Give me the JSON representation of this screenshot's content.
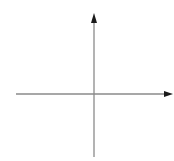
{
  "diagram": {
    "type": "coordinate-axes",
    "background": "#ffffff",
    "axis_color": "#8a8a8a",
    "arrow_color": "#1a1a1a",
    "origin": {
      "x": 94,
      "y": 94
    },
    "x_axis": {
      "x_start": 16,
      "x_end": 172,
      "y": 94,
      "arrow": "right"
    },
    "y_axis": {
      "x": 94,
      "y_start": 157,
      "y_end": 14,
      "arrow": "up"
    },
    "labels": []
  }
}
